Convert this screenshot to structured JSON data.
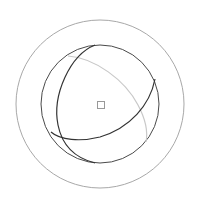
{
  "gizmo": {
    "type": "rotation-gizmo",
    "center": [
      100,
      104
    ],
    "outer_ring": {
      "radius": 84,
      "color": "#a8a8a8",
      "label": "view-ring"
    },
    "trackball": {
      "radius": 59,
      "color": "#4a4a4a",
      "label": "trackball-ring"
    },
    "axis_arc_front_1": {
      "color": "#333333",
      "path": "M95,45 C70,55 52,95 58,125 C62,145 75,158 95,163"
    },
    "axis_arc_front_2": {
      "color": "#333333",
      "path": "M155,79 C150,105 130,128 100,137 C80,142 60,140 51,132"
    },
    "axis_arc_back": {
      "color": "#c8c8c8",
      "path": "M68,56 C95,58 125,80 138,105 C146,120 148,132 146,142"
    },
    "pivot": {
      "x": 97,
      "y": 101,
      "size": 7,
      "color": "#999999"
    }
  }
}
